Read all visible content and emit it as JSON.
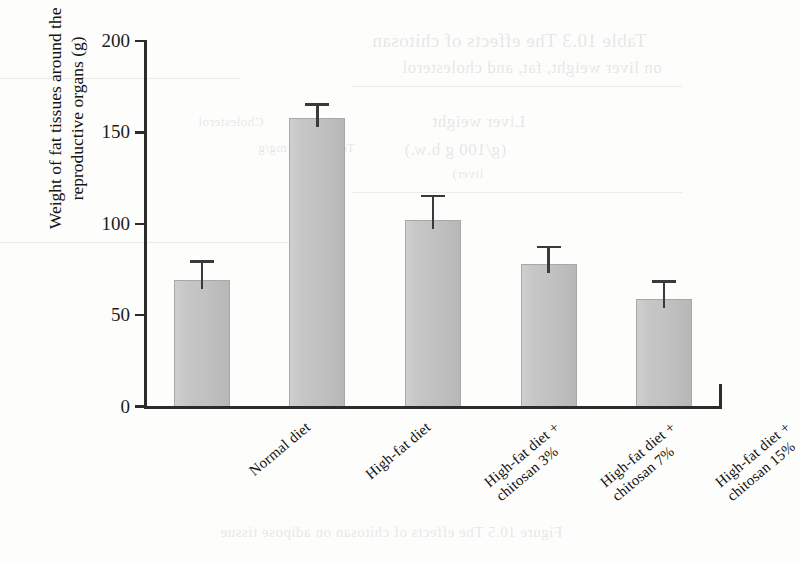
{
  "chart_data": {
    "type": "bar",
    "title": "",
    "xlabel": "",
    "ylabel": "Weight of fat tissues around the reproductive organs (g)",
    "ylabel_lines": [
      "Weight of fat tissues around the",
      "reproductive organs (g)"
    ],
    "ylim": [
      0,
      200
    ],
    "yticks": [
      0,
      50,
      100,
      150,
      200
    ],
    "ytick_labels": [
      "0",
      "50",
      "100",
      "150",
      "200"
    ],
    "grid": false,
    "legend": false,
    "units": "g",
    "categories": [
      "Normal diet",
      "High-fat diet",
      "High-fat diet +\nchitosan 3%",
      "High-fat diet +\nchitosan 7%",
      "High-fat diet +\nchitosan 15%"
    ],
    "category_lines": [
      [
        "Normal diet"
      ],
      [
        "High-fat diet"
      ],
      [
        "High-fat diet +",
        "chitosan 3%"
      ],
      [
        "High-fat diet +",
        "chitosan 7%"
      ],
      [
        "High-fat diet +",
        "chitosan 15%"
      ]
    ],
    "values": [
      69,
      158,
      102,
      78,
      59
    ],
    "errors": [
      11,
      8,
      14,
      10,
      10
    ],
    "error_upper": [
      80,
      166,
      116,
      88,
      69
    ],
    "colors": {
      "bar_fill": "#c3c3c3",
      "bar_edge": "#a8a8a8",
      "axis": "#2b2b2b",
      "error": "#3a3a3a",
      "text": "#1a1a1a",
      "background": "#fdfdfc"
    }
  },
  "bleed_through": {
    "note": "faint mirrored text showing through from the reverse side of the printed page",
    "lines": [
      "Table 10.3  The effects of chitosan",
      "on liver weight, fat, and cholesterol",
      "Liver weight",
      "(g/100 g b.w.)",
      "Total lipid (mg/g",
      "liver)",
      "Cholesterol",
      "Figure 10.5  The effects of chitosan on adipose tissue"
    ]
  }
}
